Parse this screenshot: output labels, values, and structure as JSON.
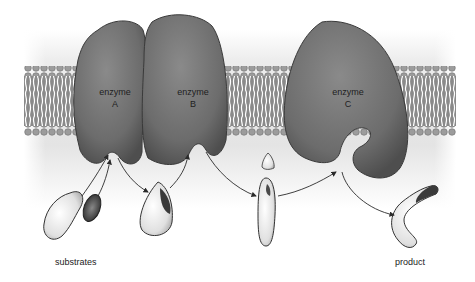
{
  "diagram": {
    "type": "membrane enzyme pathway",
    "enzymes": [
      {
        "name": "enzyme",
        "letter": "A"
      },
      {
        "name": "enzyme",
        "letter": "B"
      },
      {
        "name": "enzyme",
        "letter": "C"
      }
    ],
    "labels": {
      "substrates": "substrates",
      "product": "product"
    },
    "colors": {
      "enzyme_fill": "#6e6e6e",
      "enzyme_outline": "#3a3a3a",
      "membrane_head": "#9a9a9a",
      "membrane_tail": "#ffffff",
      "background_gradient": "#d9d9d9",
      "arrow": "#2a2a2a"
    }
  }
}
